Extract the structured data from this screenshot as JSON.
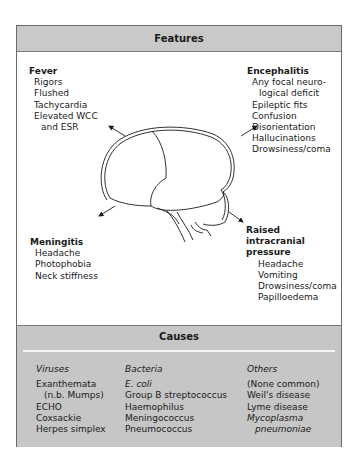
{
  "features": {
    "title": "Features",
    "fever": {
      "heading": "Fever",
      "items": [
        "Rigors",
        "Flushed",
        "Tachycardia",
        "Elevated WCC",
        "and ESR"
      ]
    },
    "encephalitis": {
      "heading": "Encephalitis",
      "items": [
        "Any focal neuro-",
        "logical deficit",
        "Epileptic fits",
        "Confusion",
        "Disorientation",
        "Hallucinations",
        "Drowsiness/coma"
      ]
    },
    "meningitis": {
      "heading": "Meningitis",
      "items": [
        "Headache",
        "Photophobia",
        "Neck stiffness"
      ]
    },
    "raised_icp": {
      "heading_lines": [
        "Raised",
        "intracranial",
        "pressure"
      ],
      "items": [
        "Headache",
        "Vomiting",
        "Drowsiness/coma",
        "Papilloedema"
      ]
    }
  },
  "causes": {
    "title": "Causes",
    "viruses": {
      "heading": "Viruses",
      "items": [
        "Exanthemata",
        "(n.b. Mumps)",
        "ECHO",
        "Coxsackie",
        "Herpes simplex"
      ]
    },
    "bacteria": {
      "heading": "Bacteria",
      "items": [
        "E. coli",
        "Group B streptococcus",
        "Haemophilus",
        "Meningococcus",
        "Pneumococcus"
      ]
    },
    "others": {
      "heading": "Others",
      "items": [
        "(None common)",
        "Weil's disease",
        "Lyme disease",
        "Mycoplasma",
        "pneumoniae"
      ]
    }
  },
  "colors": {
    "header_bg": "#c9c9c9",
    "border": "#6a6a6a",
    "text": "#1a1a1a"
  }
}
